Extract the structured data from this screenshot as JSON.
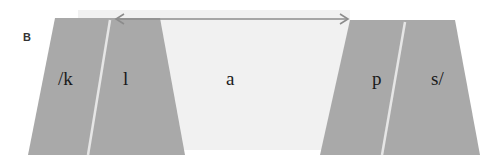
{
  "figure": {
    "panel_label": "B",
    "segments": {
      "k": "/k",
      "l": "l",
      "a": "a",
      "p": "p",
      "s": "s/"
    },
    "colors": {
      "consonant_fill": "#a9a9a9",
      "vowel_fill": "#f1f1f1",
      "divider": "#e6e6e6",
      "arrow": "#8c8c8c"
    },
    "arrow": {
      "direction": "double-headed",
      "spans": "vowel region"
    }
  }
}
